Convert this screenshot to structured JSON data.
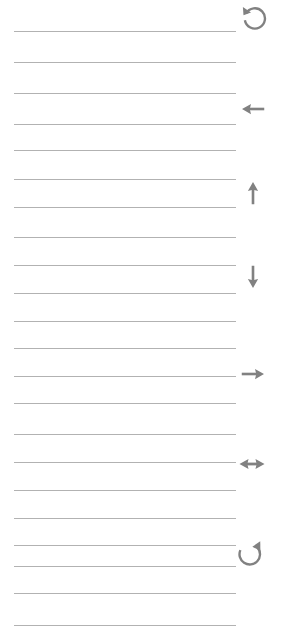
{
  "page": {
    "width": 288,
    "height": 633,
    "background_color": "#ffffff"
  },
  "rules": {
    "name": "horizontal-rule-lines",
    "color": "#b2b2b2",
    "thickness_px": 1,
    "x_start": 14,
    "x_end": 236,
    "count": 20,
    "spacing_px": 31,
    "y_positions": [
      31,
      62,
      93,
      124,
      150,
      179,
      207,
      237,
      265,
      293,
      321,
      348,
      376,
      403,
      434,
      462,
      490,
      518,
      545,
      566,
      593,
      625
    ]
  },
  "margin_glyphs": {
    "name": "right-margin-arrow-column",
    "color": "#818181",
    "items": [
      {
        "icon": "rotate-left-icon",
        "label": "Undo / rotate counter-clockwise",
        "x": 239,
        "y": 2,
        "size": 30
      },
      {
        "icon": "arrow-left-icon",
        "label": "Arrow left",
        "x": 238,
        "y": 94,
        "size": 30
      },
      {
        "icon": "arrow-up-icon",
        "label": "Arrow up",
        "x": 238,
        "y": 178,
        "size": 30
      },
      {
        "icon": "arrow-down-icon",
        "label": "Arrow down",
        "x": 238,
        "y": 262,
        "size": 30
      },
      {
        "icon": "arrow-right-icon",
        "label": "Arrow right",
        "x": 238,
        "y": 359,
        "size": 30
      },
      {
        "icon": "arrow-left-right-icon",
        "label": "Arrow left and right",
        "x": 236,
        "y": 448,
        "size": 32
      },
      {
        "icon": "rotate-right-icon",
        "label": "Redo / rotate clockwise",
        "x": 234,
        "y": 536,
        "size": 30
      }
    ]
  }
}
